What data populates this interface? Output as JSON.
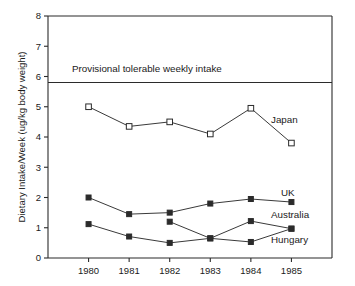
{
  "chart_data": {
    "type": "line",
    "title": "",
    "xlabel": "",
    "ylabel": "Dietary Intake/Week (ug/kg body weight)",
    "x": [
      1980,
      1981,
      1982,
      1983,
      1984,
      1985
    ],
    "categories": [
      "1980",
      "1981",
      "1982",
      "1983",
      "1984",
      "1985"
    ],
    "xlim": [
      1979.55,
      1985.55
    ],
    "ylim": [
      0,
      8
    ],
    "ytick_values": [
      0,
      1,
      2,
      3,
      4,
      5,
      6,
      7,
      8
    ],
    "ytick_labels": [
      "0",
      "1",
      "2",
      "3",
      "4",
      "5",
      "6",
      "7",
      "8"
    ],
    "grid": false,
    "legend_position": "inline-right-of-series",
    "marker_shape": "square",
    "series": [
      {
        "name": "Japan",
        "label": "Japan",
        "marker": "open-square",
        "x": [
          1980,
          1981,
          1982,
          1983,
          1984,
          1985
        ],
        "values": [
          5.0,
          4.35,
          4.5,
          4.1,
          4.95,
          3.8
        ]
      },
      {
        "name": "UK",
        "label": "UK",
        "marker": "filled-square",
        "x": [
          1980,
          1981,
          1982,
          1983,
          1984,
          1985
        ],
        "values": [
          2.0,
          1.45,
          1.5,
          1.8,
          1.95,
          1.85
        ]
      },
      {
        "name": "Australia",
        "label": "Australia",
        "marker": "filled-square",
        "x": [
          1982,
          1983,
          1984,
          1985
        ],
        "values": [
          1.2,
          0.65,
          1.22,
          0.97
        ]
      },
      {
        "name": "Hungary",
        "label": "Hungary",
        "marker": "filled-square",
        "x": [
          1980,
          1981,
          1982,
          1983,
          1984,
          1985
        ],
        "values": [
          1.12,
          0.71,
          0.5,
          0.65,
          0.53,
          0.97
        ]
      }
    ],
    "annotations": [
      {
        "name": "provisional-tolerable-weekly-intake",
        "text": "Provisional tolerable weekly intake",
        "type": "horizontal-reference-line",
        "y": 5.8,
        "text_x": 1980.15,
        "text_y": 6.15
      }
    ],
    "colors": {
      "line": "#3a3a3a",
      "axis": "#2b2b2b",
      "text": "#1a1a1a",
      "background": "#ffffff",
      "marker_fill_open": "#ffffff",
      "marker_fill_closed": "#2b2b2b"
    }
  },
  "series_labels": {
    "japan": "Japan",
    "uk": "UK",
    "australia": "Australia",
    "hungary": "Hungary"
  },
  "axis": {
    "y_title": "Dietary Intake/Week (ug/kg body weight)",
    "y_ticks": [
      "0",
      "1",
      "2",
      "3",
      "4",
      "5",
      "6",
      "7",
      "8"
    ],
    "x_ticks": [
      "1980",
      "1981",
      "1982",
      "1983",
      "1984",
      "1985"
    ]
  },
  "reference": {
    "label": "Provisional tolerable weekly intake"
  }
}
